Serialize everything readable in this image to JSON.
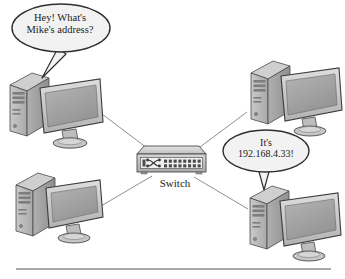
{
  "diagram": {
    "background_color": "#ffffff",
    "line_color": "#8a8a8a",
    "outline_color": "#3a3a3a",
    "device_fill_light": "#d8d8d8",
    "device_fill_mid": "#b8b8b8",
    "device_fill_dark": "#9a9a9a",
    "screen_fill": "#a8a8a8"
  },
  "speech_bubbles": [
    {
      "id": "ask",
      "line1": "Hey! What's",
      "line2": "Mike's address?",
      "speaker": "computer-top-left"
    },
    {
      "id": "reply",
      "line1": "It's",
      "line2": "192.168.4.33!",
      "speaker": "computer-bottom-right"
    }
  ],
  "devices": {
    "switch": {
      "label": "Switch",
      "port_count": 16
    },
    "computers": [
      {
        "id": "computer-top-left",
        "position": "top-left"
      },
      {
        "id": "computer-top-right",
        "position": "top-right"
      },
      {
        "id": "computer-bottom-left",
        "position": "bottom-left"
      },
      {
        "id": "computer-bottom-right",
        "position": "bottom-right"
      }
    ]
  },
  "connections": [
    {
      "from": "computer-top-left",
      "to": "switch"
    },
    {
      "from": "computer-top-right",
      "to": "switch"
    },
    {
      "from": "computer-bottom-left",
      "to": "switch"
    },
    {
      "from": "computer-bottom-right",
      "to": "switch"
    }
  ],
  "footer": {
    "rule": true
  }
}
